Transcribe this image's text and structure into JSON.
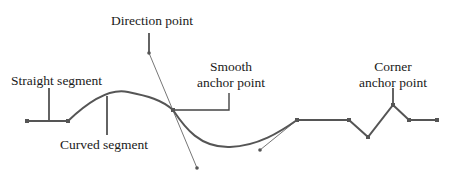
{
  "labels": {
    "direction_point": "Direction point",
    "straight_segment": "Straight segment",
    "curved_segment": "Curved segment",
    "smooth_anchor_line1": "Smooth",
    "smooth_anchor_line2": "anchor point",
    "corner_anchor_line1": "Corner",
    "corner_anchor_line2": "anchor point"
  },
  "colors": {
    "path": "#555555",
    "callout": "#222222",
    "handle": "#666666",
    "text": "#1a1a1a"
  }
}
